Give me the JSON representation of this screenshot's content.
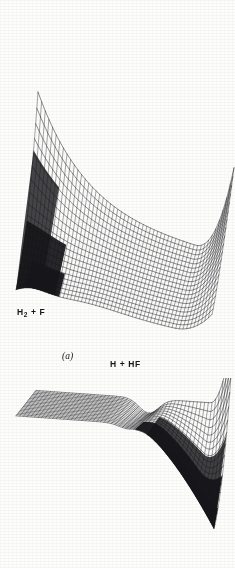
{
  "figure": {
    "kind": "scanned-book-figure",
    "background_color": "#fdfdfc",
    "ink_color": "#16161a"
  },
  "panels": [
    {
      "tag": "(a)",
      "tag_x": 62,
      "tag_y": 355,
      "reactant_label": "H₂ + F",
      "reactant_html": "H<sub>2</sub> + F",
      "reactant_x": 17,
      "reactant_y": 312,
      "product_label": "H + HF",
      "product_x": 110,
      "product_y": 362,
      "surface": {
        "type": "mesh-surface",
        "style": "attractive-early-barrier",
        "u_lines": 46,
        "v_lines": 22,
        "has_dark_well": true,
        "well_region": "left-front"
      }
    },
    {
      "tag": "(b)",
      "tag_x": 57,
      "tag_y": 532,
      "reactant_label": "H₂ + F",
      "reactant_html": "H<sub>2</sub> + F",
      "reactant_x": 22,
      "reactant_y": 424,
      "product_label": "H + HF",
      "product_x": 132,
      "product_y": 542,
      "surface": {
        "type": "mesh-surface",
        "style": "flat-plateau-deep-exit-valley",
        "u_lines": 46,
        "v_lines": 22,
        "has_dark_well": true,
        "well_region": "right-front"
      }
    }
  ],
  "chart_data": {
    "type": "surface",
    "title": "",
    "xlabel": "",
    "ylabel": "",
    "panels": [
      {
        "name": "(a)",
        "axis_labels": [
          "H₂ + F",
          "H + HF"
        ],
        "features": [
          "steep repulsive wall (upper left)",
          "saddle / barrier",
          "dark deep valley at left front",
          "broad gently curved plateau at right"
        ]
      },
      {
        "name": "(b)",
        "axis_labels": [
          "H₂ + F",
          "H + HF"
        ],
        "features": [
          "flat entrance channel plateau (left)",
          "narrow saddle near centre",
          "very deep dark exit valley (right front)",
          "steep wall at far right"
        ]
      }
    ]
  }
}
